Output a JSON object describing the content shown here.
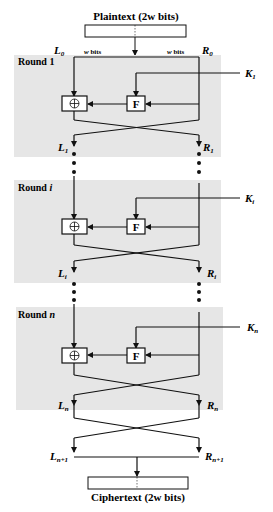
{
  "diagram": {
    "type": "feistel-cipher",
    "input_label": "Plaintext (2w bits)",
    "output_label": "Ciphertext (2w bits)",
    "half_width_label": "w bits",
    "colors": {
      "round_bg": "#e6e6e6",
      "line": "#111111"
    },
    "rounds": [
      {
        "title": "Round 1",
        "key": "K",
        "key_sub": "1",
        "in_left": "L",
        "in_left_sub": "0",
        "in_right": "R",
        "in_right_sub": "0",
        "out_left": "L",
        "out_left_sub": "1",
        "out_right": "R",
        "out_right_sub": "1"
      },
      {
        "title": "Round ",
        "title_var": "i",
        "key": "K",
        "key_sub": "i",
        "out_left": "L",
        "out_left_sub": "i",
        "out_right": "R",
        "out_right_sub": "i"
      },
      {
        "title": "Round ",
        "title_var": "n",
        "key": "K",
        "key_sub": "n",
        "out_left": "L",
        "out_left_sub": "n",
        "out_right": "R",
        "out_right_sub": "n"
      }
    ],
    "final": {
      "left": "L",
      "left_sub": "n+1",
      "right": "R",
      "right_sub": "n+1"
    },
    "function_label": "F",
    "xor_symbol": "⊕"
  }
}
